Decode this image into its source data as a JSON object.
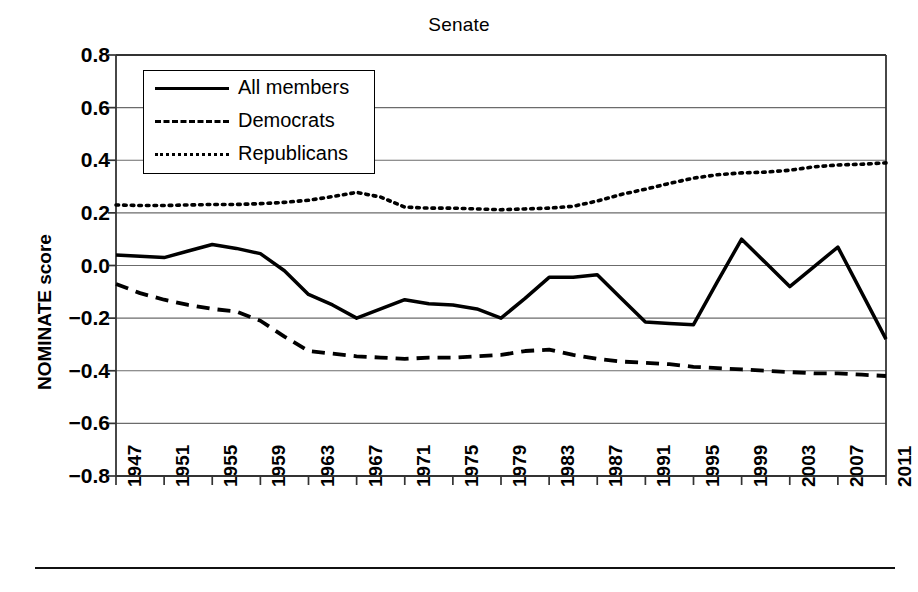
{
  "chart_data": {
    "type": "line",
    "title": "Senate",
    "xlabel": "",
    "ylabel": "NOMINATE score",
    "ylim": [
      -0.8,
      0.8
    ],
    "xlim": [
      1947,
      2011
    ],
    "ytick_labels": [
      "0.8",
      "0.6",
      "0.4",
      "0.2",
      "0.0",
      "−0.2",
      "−0.4",
      "−0.6",
      "−0.8"
    ],
    "ytick_values": [
      0.8,
      0.6,
      0.4,
      0.2,
      0.0,
      -0.2,
      -0.4,
      -0.6,
      -0.8
    ],
    "xtick_labels": [
      "1947",
      "1951",
      "1955",
      "1959",
      "1963",
      "1967",
      "1971",
      "1975",
      "1979",
      "1983",
      "1987",
      "1991",
      "1995",
      "1999",
      "2003",
      "2007",
      "2011"
    ],
    "xtick_values": [
      1947,
      1951,
      1955,
      1959,
      1963,
      1967,
      1971,
      1975,
      1979,
      1983,
      1987,
      1991,
      1995,
      1999,
      2003,
      2007,
      2011
    ],
    "grid": "horizontal",
    "legend_position": "top-left",
    "x": [
      1947,
      1949,
      1951,
      1953,
      1955,
      1957,
      1959,
      1961,
      1963,
      1965,
      1967,
      1969,
      1971,
      1973,
      1975,
      1977,
      1979,
      1981,
      1983,
      1985,
      1987,
      1989,
      1991,
      1993,
      1995,
      1997,
      1999,
      2001,
      2003,
      2005,
      2007,
      2009,
      2011
    ],
    "series": [
      {
        "name": "All members",
        "style": "solid",
        "color": "#000000",
        "values": [
          0.04,
          0.035,
          0.03,
          0.055,
          0.08,
          0.065,
          0.045,
          -0.02,
          -0.11,
          -0.15,
          -0.2,
          -0.165,
          -0.13,
          -0.145,
          -0.15,
          -0.165,
          -0.2,
          -0.125,
          -0.045,
          -0.045,
          -0.035,
          -0.125,
          -0.215,
          -0.22,
          -0.225,
          -0.06,
          0.1,
          0.01,
          -0.08,
          -0.005,
          0.07,
          -0.105,
          -0.28
        ]
      },
      {
        "name": "Democrats",
        "style": "dashed",
        "color": "#000000",
        "values": [
          -0.07,
          -0.105,
          -0.13,
          -0.15,
          -0.165,
          -0.175,
          -0.21,
          -0.27,
          -0.325,
          -0.335,
          -0.345,
          -0.35,
          -0.355,
          -0.35,
          -0.35,
          -0.345,
          -0.34,
          -0.325,
          -0.32,
          -0.34,
          -0.355,
          -0.365,
          -0.37,
          -0.375,
          -0.385,
          -0.39,
          -0.395,
          -0.4,
          -0.405,
          -0.41,
          -0.41,
          -0.415,
          -0.42
        ]
      },
      {
        "name": "Republicans",
        "style": "dotted",
        "color": "#000000",
        "values": [
          0.23,
          0.228,
          0.228,
          0.23,
          0.232,
          0.232,
          0.235,
          0.24,
          0.248,
          0.262,
          0.278,
          0.26,
          0.222,
          0.218,
          0.218,
          0.215,
          0.212,
          0.215,
          0.218,
          0.225,
          0.245,
          0.27,
          0.29,
          0.312,
          0.332,
          0.345,
          0.352,
          0.355,
          0.362,
          0.375,
          0.382,
          0.385,
          0.39
        ]
      }
    ]
  },
  "legend": {
    "items": [
      {
        "label": "All members",
        "style": "solid"
      },
      {
        "label": "Democrats",
        "style": "dashed"
      },
      {
        "label": "Republicans",
        "style": "dotted"
      }
    ]
  }
}
